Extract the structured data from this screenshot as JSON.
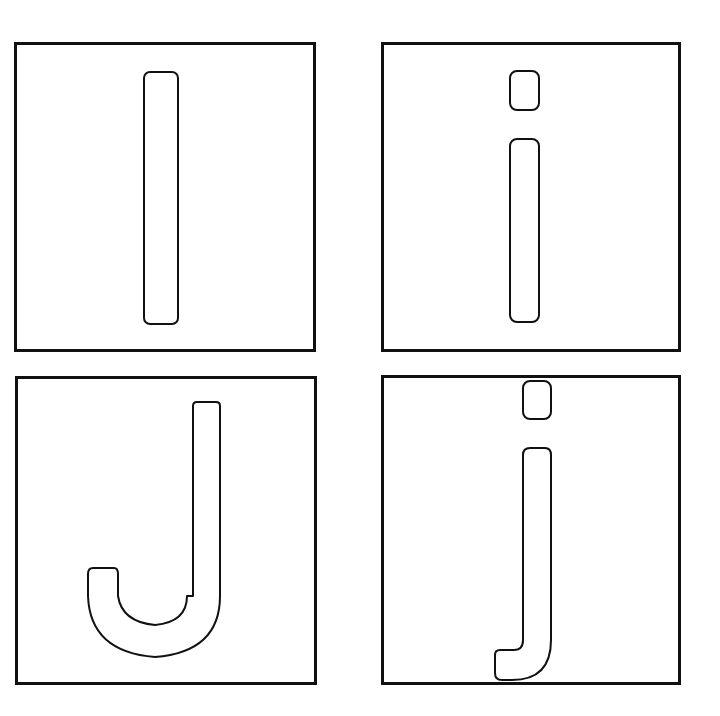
{
  "worksheet": {
    "cards": [
      {
        "letter": "I",
        "case": "uppercase",
        "box": {
          "x": 15,
          "y": 43,
          "w": 300,
          "h": 308
        }
      },
      {
        "letter": "i",
        "case": "lowercase",
        "box": {
          "x": 382,
          "y": 43,
          "w": 298,
          "h": 308
        }
      },
      {
        "letter": "J",
        "case": "uppercase",
        "box": {
          "x": 15,
          "y": 377,
          "w": 301,
          "h": 307
        }
      },
      {
        "letter": "j",
        "case": "lowercase",
        "box": {
          "x": 382,
          "y": 376,
          "w": 298,
          "h": 308
        }
      }
    ],
    "colors": {
      "stroke": "#111111",
      "fill": "#ffffff",
      "background": "#ffffff"
    }
  }
}
